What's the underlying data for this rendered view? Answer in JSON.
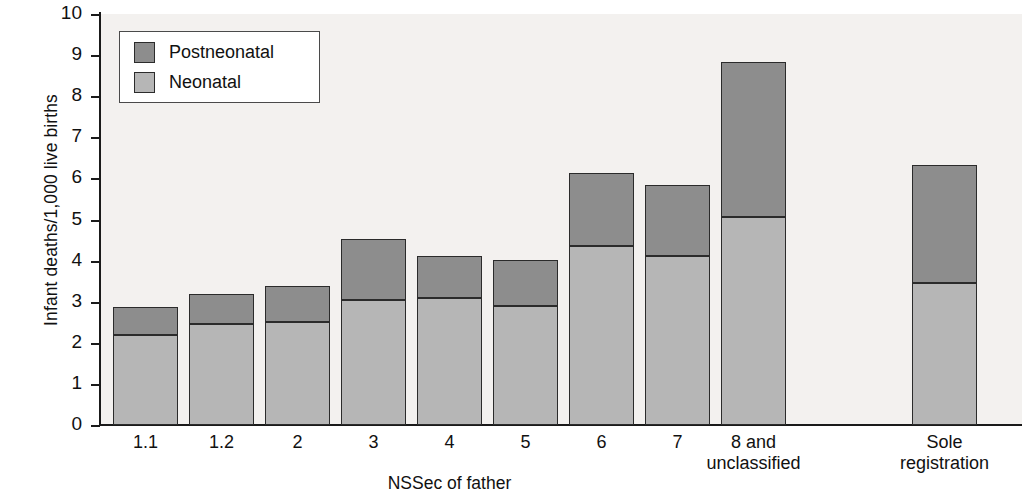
{
  "chart_data": {
    "type": "bar",
    "subtype": "stacked",
    "title": "",
    "xlabel": "NSSec of father",
    "ylabel": "Infant deaths/1,000 live births",
    "ylim": [
      0,
      10
    ],
    "ytick_labels": [
      "0",
      "1",
      "2",
      "3",
      "4",
      "5",
      "6",
      "7",
      "8",
      "9",
      "10"
    ],
    "yticks": [
      0,
      1,
      2,
      3,
      4,
      5,
      6,
      7,
      8,
      9,
      10
    ],
    "grid": false,
    "legend_position": "upper left",
    "categories": [
      "1.1",
      "1.2",
      "2",
      "3",
      "4",
      "5",
      "6",
      "7",
      "8 and unclassified",
      "Sole registration"
    ],
    "category_lines": [
      [
        "1.1"
      ],
      [
        "1.2"
      ],
      [
        "2"
      ],
      [
        "3"
      ],
      [
        "4"
      ],
      [
        "5"
      ],
      [
        "6"
      ],
      [
        "7"
      ],
      [
        "8 and",
        "unclassified"
      ],
      [
        "Sole",
        "registration"
      ]
    ],
    "series": [
      {
        "name": "Neonatal",
        "color": "#b6b6b6",
        "values": [
          2.2,
          2.45,
          2.5,
          3.05,
          3.1,
          2.9,
          4.35,
          4.1,
          5.05,
          3.45
        ]
      },
      {
        "name": "Postneonatal",
        "color": "#8d8d8d",
        "values": [
          0.67,
          0.73,
          0.87,
          1.47,
          1.02,
          1.12,
          1.77,
          1.75,
          3.78,
          2.87
        ]
      }
    ],
    "totals": [
      2.87,
      3.18,
      3.37,
      4.52,
      4.12,
      4.02,
      6.12,
      5.85,
      8.83,
      6.32
    ],
    "legend_entries": [
      {
        "label": "Postneonatal",
        "color": "#8d8d8d"
      },
      {
        "label": "Neonatal",
        "color": "#b6b6b6"
      }
    ],
    "colors": {
      "postneonatal": "#8d8d8d",
      "neonatal": "#b6b6b6",
      "plot_background": "#f3f1ef",
      "axis": "#1a1a1a",
      "bar_outline": "#2b2b2b"
    }
  }
}
